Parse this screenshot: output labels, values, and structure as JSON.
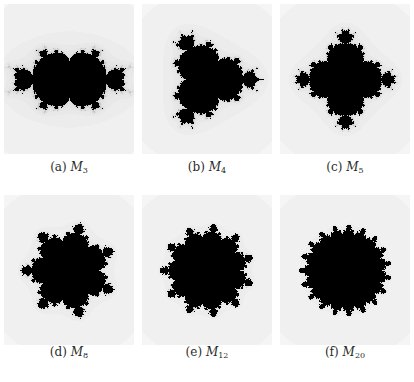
{
  "figure": {
    "panels": [
      {
        "label": "(a)",
        "symbol": "M",
        "subscript": "3",
        "degree": 3
      },
      {
        "label": "(b)",
        "symbol": "M",
        "subscript": "4",
        "degree": 4
      },
      {
        "label": "(c)",
        "symbol": "M",
        "subscript": "5",
        "degree": 5
      },
      {
        "label": "(d)",
        "symbol": "M",
        "subscript": "8",
        "degree": 8
      },
      {
        "label": "(e)",
        "symbol": "M",
        "subscript": "12",
        "degree": 12
      },
      {
        "label": "(f)",
        "symbol": "M",
        "subscript": "20",
        "degree": 20
      }
    ],
    "colors": {
      "set": "#000000",
      "background": "#ffffff"
    }
  }
}
